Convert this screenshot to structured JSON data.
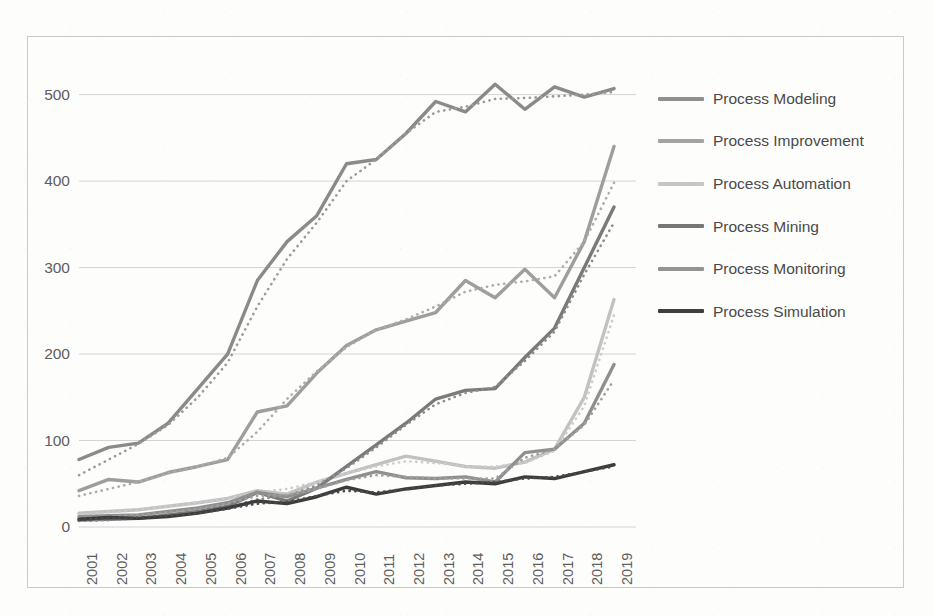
{
  "chart_data": {
    "type": "line",
    "title": "",
    "xlabel": "",
    "ylabel": "",
    "ylim": [
      0,
      540
    ],
    "yticks": [
      0,
      100,
      200,
      300,
      400,
      500
    ],
    "grid": true,
    "legend_position": "right",
    "note": "Each series is drawn twice: a solid line (actual counts) and a dotted trend line just below/through it.",
    "categories": [
      "2001",
      "2002",
      "2003",
      "2004",
      "2005",
      "2006",
      "2007",
      "2008",
      "2009",
      "2010",
      "2011",
      "2012",
      "2013",
      "2014",
      "2015",
      "2016",
      "2017",
      "2018",
      "2019"
    ],
    "series": [
      {
        "name": "Process Modeling",
        "color": "#8a8a8a",
        "style": "solid",
        "values": [
          78,
          92,
          97,
          120,
          160,
          200,
          285,
          330,
          360,
          420,
          425,
          455,
          492,
          480,
          512,
          483,
          509,
          497,
          507
        ]
      },
      {
        "name": "Process Modeling (trend)",
        "color": "#9b9b9b",
        "style": "dotted",
        "values": [
          60,
          78,
          96,
          118,
          150,
          190,
          255,
          310,
          352,
          400,
          425,
          455,
          480,
          486,
          495,
          496,
          498,
          500,
          503
        ]
      },
      {
        "name": "Process Improvement",
        "color": "#9e9e9e",
        "style": "solid",
        "values": [
          42,
          55,
          52,
          63,
          70,
          78,
          133,
          140,
          178,
          210,
          228,
          238,
          248,
          285,
          265,
          298,
          265,
          330,
          440
        ]
      },
      {
        "name": "Process Improvement (trend)",
        "color": "#acacac",
        "style": "dotted",
        "values": [
          36,
          44,
          52,
          62,
          70,
          80,
          110,
          148,
          180,
          208,
          228,
          240,
          255,
          272,
          280,
          284,
          290,
          330,
          398
        ]
      },
      {
        "name": "Process Automation",
        "color": "#c2c2c2",
        "style": "solid",
        "values": [
          16,
          18,
          20,
          24,
          28,
          33,
          42,
          38,
          52,
          62,
          72,
          82,
          76,
          70,
          68,
          75,
          90,
          150,
          263
        ]
      },
      {
        "name": "Process Automation (trend)",
        "color": "#cccccc",
        "style": "dotted",
        "values": [
          14,
          17,
          20,
          24,
          28,
          33,
          40,
          44,
          52,
          62,
          70,
          76,
          74,
          70,
          70,
          74,
          88,
          140,
          245
        ]
      },
      {
        "name": "Process Mining",
        "color": "#7a7a7a",
        "style": "solid",
        "values": [
          8,
          9,
          10,
          14,
          18,
          24,
          40,
          30,
          45,
          70,
          95,
          120,
          148,
          158,
          160,
          196,
          230,
          300,
          370
        ]
      },
      {
        "name": "Process Mining (trend)",
        "color": "#8d8d8d",
        "style": "dotted",
        "values": [
          7,
          8,
          10,
          13,
          17,
          23,
          32,
          36,
          48,
          68,
          92,
          118,
          142,
          155,
          162,
          192,
          226,
          292,
          352
        ]
      },
      {
        "name": "Process Monitoring",
        "color": "#8f8f8f",
        "style": "solid",
        "values": [
          12,
          13,
          14,
          18,
          22,
          28,
          40,
          35,
          45,
          55,
          64,
          57,
          56,
          58,
          52,
          86,
          90,
          120,
          188
        ]
      },
      {
        "name": "Process Monitoring (trend)",
        "color": "#a0a0a0",
        "style": "dotted",
        "values": [
          11,
          12,
          14,
          17,
          21,
          27,
          36,
          37,
          44,
          54,
          60,
          58,
          56,
          56,
          56,
          80,
          90,
          118,
          170
        ]
      },
      {
        "name": "Process Simulation",
        "color": "#3c3c3c",
        "style": "solid",
        "values": [
          9,
          11,
          10,
          12,
          16,
          22,
          30,
          27,
          35,
          46,
          38,
          44,
          48,
          52,
          50,
          58,
          56,
          64,
          72
        ]
      },
      {
        "name": "Process Simulation (trend)",
        "color": "#4a4a4a",
        "style": "dotted",
        "values": [
          8,
          10,
          11,
          13,
          16,
          21,
          27,
          29,
          36,
          42,
          40,
          44,
          48,
          50,
          52,
          56,
          58,
          64,
          70
        ]
      }
    ]
  },
  "legend": {
    "items": [
      {
        "label": "Process Modeling",
        "color": "#8f8f8f"
      },
      {
        "label": "Process Improvement",
        "color": "#a3a3a3"
      },
      {
        "label": "Process Automation",
        "color": "#c6c6c6"
      },
      {
        "label": "Process Mining",
        "color": "#777777"
      },
      {
        "label": "Process Monitoring",
        "color": "#949494"
      },
      {
        "label": "Process Simulation",
        "color": "#3f3f3f"
      }
    ]
  },
  "axes": {
    "y_ticks": [
      "500",
      "400",
      "300",
      "200",
      "100",
      "0"
    ],
    "x_ticks": [
      "2001",
      "2002",
      "2003",
      "2004",
      "2005",
      "2006",
      "2007",
      "2008",
      "2009",
      "2010",
      "2011",
      "2012",
      "2013",
      "2014",
      "2015",
      "2016",
      "2017",
      "2018",
      "2019"
    ]
  },
  "colors": {
    "gridline": "#d4d4d2",
    "axis_text": "#5e5e5e",
    "frame": "#c9c9c7",
    "background": "#fdfdfc"
  }
}
